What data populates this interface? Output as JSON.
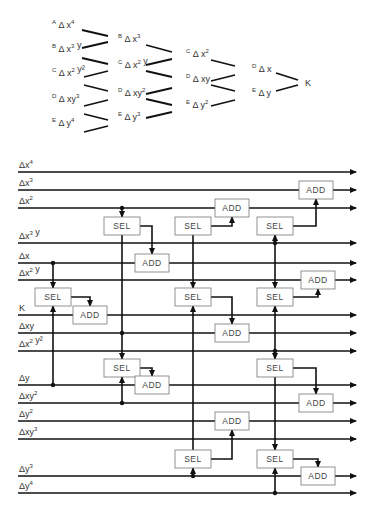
{
  "tree": {
    "columns": [
      {
        "items": [
          {
            "prefix": "A",
            "label": "Δ x",
            "sup": "4",
            "x": 52,
            "y": 28
          },
          {
            "prefix": "B",
            "label": "Δ x",
            "sup": "3",
            "tail": " y",
            "x": 52,
            "y": 52
          },
          {
            "prefix": "C",
            "label": "Δ x",
            "sup": "2",
            "tail": " y²",
            "x": 52,
            "y": 76
          },
          {
            "prefix": "D",
            "label": "Δ xy",
            "sup": "3",
            "x": 52,
            "y": 102
          },
          {
            "prefix": "E",
            "label": "Δ y",
            "sup": "4",
            "x": 52,
            "y": 126
          }
        ]
      },
      {
        "items": [
          {
            "prefix": "B",
            "label": "Δ x",
            "sup": "3",
            "x": 118,
            "y": 42
          },
          {
            "prefix": "C",
            "label": "Δ x",
            "sup": "2",
            "tail": " y",
            "x": 118,
            "y": 68
          },
          {
            "prefix": "D",
            "label": "Δ xy",
            "sup": "2",
            "x": 118,
            "y": 96
          },
          {
            "prefix": "E",
            "label": "Δ y",
            "sup": "3",
            "x": 118,
            "y": 120
          }
        ]
      },
      {
        "items": [
          {
            "prefix": "C",
            "label": "Δ x",
            "sup": "2",
            "x": 186,
            "y": 57
          },
          {
            "prefix": "D",
            "label": "Δ xy",
            "x": 186,
            "y": 82
          },
          {
            "prefix": "E",
            "label": "Δ y",
            "sup": "2",
            "x": 186,
            "y": 108
          }
        ]
      },
      {
        "items": [
          {
            "prefix": "D",
            "label": "Δ x",
            "x": 252,
            "y": 72
          },
          {
            "prefix": "E",
            "label": "Δ y",
            "x": 252,
            "y": 96
          }
        ]
      }
    ],
    "result": {
      "label": "K",
      "x": 305,
      "y": 86
    }
  },
  "circuit": {
    "wire_x_start": 18,
    "wire_x_end": 356,
    "wires": [
      {
        "label": "Δx",
        "sup": "4",
        "y": 172
      },
      {
        "label": "Δx",
        "sup": "3",
        "y": 190
      },
      {
        "label": "Δx",
        "sup": "2",
        "y": 208
      },
      {
        "label": "Δx",
        "sup": "3",
        "tail": " y",
        "y": 243
      },
      {
        "label": "Δx",
        "y": 263
      },
      {
        "label": "Δx",
        "sup": "2",
        "tail": " y",
        "y": 280
      },
      {
        "label": "K",
        "y": 315
      },
      {
        "label": "Δxy",
        "y": 333
      },
      {
        "label": "Δx",
        "sup": "2",
        "tail": " y²",
        "y": 351
      },
      {
        "label": "Δy",
        "y": 385
      },
      {
        "label": "Δxy",
        "sup": "2",
        "y": 403
      },
      {
        "label": "Δy",
        "sup": "2",
        "y": 421
      },
      {
        "label": "Δxy",
        "sup": "3",
        "y": 439
      },
      {
        "label": "Δy",
        "sup": "3",
        "y": 476
      },
      {
        "label": "Δy",
        "sup": "4",
        "y": 493
      }
    ],
    "sel_label": "SEL",
    "add_label": "ADD",
    "sel_boxes": [
      {
        "x": 122,
        "y": 226
      },
      {
        "x": 193,
        "y": 226
      },
      {
        "x": 275,
        "y": 226
      },
      {
        "x": 53,
        "y": 297
      },
      {
        "x": 193,
        "y": 297
      },
      {
        "x": 275,
        "y": 297
      },
      {
        "x": 122,
        "y": 368
      },
      {
        "x": 275,
        "y": 368
      },
      {
        "x": 193,
        "y": 459
      },
      {
        "x": 275,
        "y": 459
      }
    ],
    "add_boxes": [
      {
        "x": 316,
        "y": 190
      },
      {
        "x": 232,
        "y": 208
      },
      {
        "x": 152,
        "y": 263
      },
      {
        "x": 318,
        "y": 280
      },
      {
        "x": 90,
        "y": 315
      },
      {
        "x": 232,
        "y": 333
      },
      {
        "x": 152,
        "y": 385
      },
      {
        "x": 316,
        "y": 403
      },
      {
        "x": 232,
        "y": 421
      },
      {
        "x": 318,
        "y": 476
      }
    ]
  }
}
